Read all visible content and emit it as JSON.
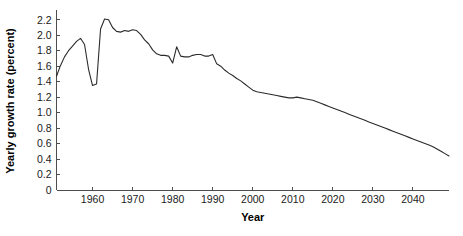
{
  "chart_data": {
    "type": "line",
    "title": "",
    "xlabel": "Year",
    "ylabel": "Yearly growth rate (percent)",
    "xlim": [
      1951,
      2049
    ],
    "ylim": [
      0,
      2.3
    ],
    "grid": false,
    "legend": null,
    "xticks": [
      1960,
      1970,
      1980,
      1990,
      2000,
      2010,
      2020,
      2030,
      2040
    ],
    "xtick_labels": [
      "1960",
      "1970",
      "1980",
      "1990",
      "2000",
      "2010",
      "2020",
      "2030",
      "2040"
    ],
    "yticks": [
      0,
      0.2,
      0.4,
      0.6,
      0.8,
      1.0,
      1.2,
      1.4,
      1.6,
      1.8,
      2.0,
      2.2
    ],
    "ytick_labels": [
      "0",
      "0.2",
      "0.4",
      "0.6",
      "0.8",
      "1.0",
      "1.2",
      "1.4",
      "1.6",
      "1.8",
      "2.0",
      "2.2"
    ],
    "series": [
      {
        "name": "World population yearly growth rate",
        "color": "#2b2b2b",
        "x": [
          1951,
          1952,
          1953,
          1954,
          1955,
          1956,
          1957,
          1958,
          1959,
          1960,
          1961,
          1962,
          1963,
          1964,
          1965,
          1966,
          1967,
          1968,
          1969,
          1970,
          1971,
          1972,
          1973,
          1974,
          1975,
          1976,
          1977,
          1978,
          1979,
          1980,
          1981,
          1982,
          1983,
          1984,
          1985,
          1986,
          1987,
          1988,
          1989,
          1990,
          1991,
          1992,
          1993,
          1994,
          1995,
          1996,
          1997,
          1998,
          1999,
          2000,
          2001,
          2002,
          2003,
          2004,
          2005,
          2006,
          2007,
          2008,
          2009,
          2010,
          2011,
          2012,
          2013,
          2014,
          2015,
          2016,
          2017,
          2018,
          2019,
          2020,
          2021,
          2022,
          2023,
          2024,
          2025,
          2026,
          2027,
          2028,
          2029,
          2030,
          2031,
          2032,
          2033,
          2034,
          2035,
          2036,
          2037,
          2038,
          2039,
          2040,
          2041,
          2042,
          2043,
          2044,
          2045,
          2046,
          2047,
          2048,
          2049
        ],
        "y": [
          1.47,
          1.61,
          1.72,
          1.8,
          1.86,
          1.92,
          1.96,
          1.88,
          1.56,
          1.35,
          1.37,
          2.08,
          2.21,
          2.2,
          2.1,
          2.05,
          2.04,
          2.06,
          2.05,
          2.07,
          2.06,
          2.01,
          1.94,
          1.89,
          1.81,
          1.76,
          1.74,
          1.74,
          1.73,
          1.64,
          1.85,
          1.73,
          1.72,
          1.72,
          1.74,
          1.75,
          1.75,
          1.73,
          1.73,
          1.75,
          1.63,
          1.6,
          1.55,
          1.51,
          1.48,
          1.44,
          1.41,
          1.37,
          1.33,
          1.29,
          1.27,
          1.26,
          1.25,
          1.24,
          1.23,
          1.22,
          1.21,
          1.2,
          1.19,
          1.19,
          1.2,
          1.19,
          1.18,
          1.17,
          1.16,
          1.14,
          1.12,
          1.1,
          1.08,
          1.06,
          1.04,
          1.02,
          1.0,
          0.98,
          0.96,
          0.94,
          0.92,
          0.9,
          0.88,
          0.86,
          0.84,
          0.82,
          0.8,
          0.78,
          0.76,
          0.74,
          0.72,
          0.7,
          0.68,
          0.66,
          0.64,
          0.62,
          0.6,
          0.58,
          0.56,
          0.53,
          0.5,
          0.47,
          0.44
        ]
      }
    ]
  },
  "axes": {
    "x_title": "Year",
    "y_title": "Yearly growth rate (percent)"
  }
}
